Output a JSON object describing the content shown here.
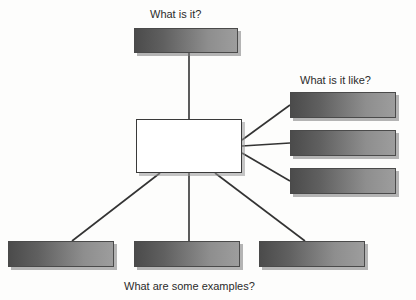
{
  "diagram": {
    "type": "concept-map",
    "background_color": "#fdfdfc",
    "box_fill_dark": "#4b4b4b",
    "box_fill_light": "#9d9d9d",
    "box_border_color": "#4a4a4a",
    "center_fill": "#ffffff",
    "line_color": "#333333",
    "text_color": "#2b2b2b",
    "captions": [
      {
        "id": "what-is-it",
        "text": "What is it?",
        "x": 150,
        "y": 8
      },
      {
        "id": "what-is-it-like",
        "text": "What is it like?",
        "x": 300,
        "y": 74
      },
      {
        "id": "what-are-some-examples",
        "text": "What are some examples?",
        "x": 124,
        "y": 280
      }
    ],
    "center_node": {
      "id": "center-concept",
      "label": "",
      "x": 136,
      "y": 119,
      "width": 106,
      "height": 54
    },
    "nodes": [
      {
        "id": "definition-box",
        "group": "what-is-it",
        "label": "",
        "x": 134,
        "y": 28,
        "width": 104,
        "height": 25
      },
      {
        "id": "characteristic-box-1",
        "group": "what-is-it-like",
        "label": "",
        "x": 290,
        "y": 92,
        "width": 106,
        "height": 26
      },
      {
        "id": "characteristic-box-2",
        "group": "what-is-it-like",
        "label": "",
        "x": 290,
        "y": 130,
        "width": 106,
        "height": 26
      },
      {
        "id": "characteristic-box-3",
        "group": "what-is-it-like",
        "label": "",
        "x": 290,
        "y": 168,
        "width": 106,
        "height": 26
      },
      {
        "id": "example-box-1",
        "group": "what-are-some-examples",
        "label": "",
        "x": 8,
        "y": 241,
        "width": 106,
        "height": 26
      },
      {
        "id": "example-box-2",
        "group": "what-are-some-examples",
        "label": "",
        "x": 134,
        "y": 241,
        "width": 106,
        "height": 26
      },
      {
        "id": "example-box-3",
        "group": "what-are-some-examples",
        "label": "",
        "x": 259,
        "y": 241,
        "width": 106,
        "height": 26
      }
    ],
    "connectors": [
      {
        "id": "connector-center-to-definition",
        "x1": 189,
        "y1": 119,
        "x2": 189,
        "y2": 53
      },
      {
        "id": "connector-center-to-characteristic-1",
        "x1": 242,
        "y1": 140,
        "x2": 290,
        "y2": 105
      },
      {
        "id": "connector-center-to-characteristic-2",
        "x1": 242,
        "y1": 146,
        "x2": 290,
        "y2": 143
      },
      {
        "id": "connector-center-to-characteristic-3",
        "x1": 242,
        "y1": 153,
        "x2": 290,
        "y2": 181
      },
      {
        "id": "connector-center-to-example-1",
        "x1": 160,
        "y1": 173,
        "x2": 72,
        "y2": 241
      },
      {
        "id": "connector-center-to-example-2",
        "x1": 189,
        "y1": 173,
        "x2": 189,
        "y2": 241
      },
      {
        "id": "connector-center-to-example-3",
        "x1": 215,
        "y1": 173,
        "x2": 305,
        "y2": 241
      }
    ]
  }
}
